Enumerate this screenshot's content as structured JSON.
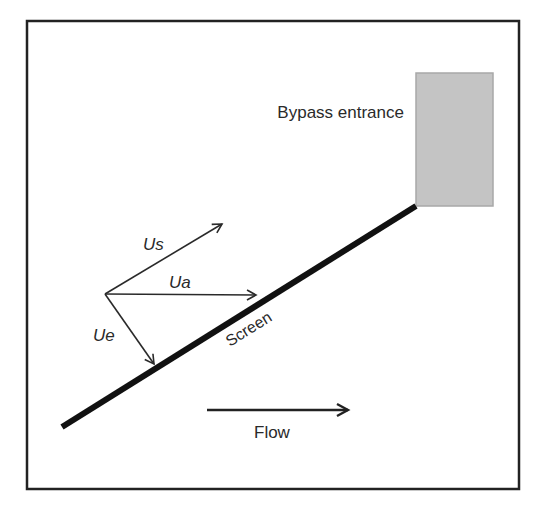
{
  "diagram": {
    "labels": {
      "bypass_entrance": "Bypass entrance",
      "screen": "Screen",
      "flow": "Flow",
      "us": "Us",
      "ua": "Ua",
      "ue": "Ue"
    },
    "colors": {
      "frame": "#222222",
      "screen_line": "#111111",
      "bypass_fill": "#c4c4c4",
      "bypass_stroke": "#a8a8a8",
      "vector": "#2a2a2a",
      "text": "#2a2a2a"
    },
    "vectors": [
      {
        "name": "Us",
        "from": [
          105,
          294
        ],
        "to": [
          222,
          224
        ]
      },
      {
        "name": "Ua",
        "from": [
          105,
          294
        ],
        "to": [
          256,
          295
        ]
      },
      {
        "name": "Ue",
        "from": [
          105,
          294
        ],
        "to": [
          154,
          364
        ]
      }
    ],
    "screen_line": {
      "from": [
        62,
        427
      ],
      "to": [
        416,
        206
      ]
    },
    "flow_arrow": {
      "from": [
        207,
        410
      ],
      "to": [
        348,
        410
      ]
    }
  }
}
